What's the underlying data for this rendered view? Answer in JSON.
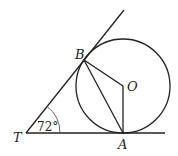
{
  "diagram": {
    "type": "geometry",
    "points": {
      "T": {
        "label": "T",
        "x": 26,
        "y": 133
      },
      "B": {
        "label": "B",
        "x": 84,
        "y": 60
      },
      "O": {
        "label": "O",
        "x": 123,
        "y": 86
      },
      "A": {
        "label": "A",
        "x": 123,
        "y": 133
      }
    },
    "circle": {
      "center": "O",
      "cx": 123,
      "cy": 86,
      "r": 47
    },
    "segments": [
      {
        "from": "T",
        "to": "A",
        "extended": true
      },
      {
        "from": "T",
        "to": "B",
        "extended": true
      },
      {
        "from": "B",
        "to": "O"
      },
      {
        "from": "O",
        "to": "A"
      },
      {
        "from": "B",
        "to": "A"
      }
    ],
    "angle": {
      "vertex": "T",
      "label": "72°",
      "value": 72
    },
    "colors": {
      "stroke": "#222222",
      "background": "#ffffff"
    }
  }
}
